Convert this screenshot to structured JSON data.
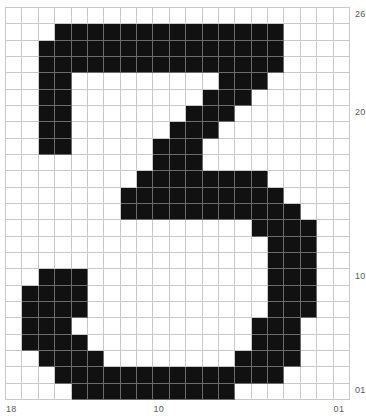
{
  "chart_data": {
    "type": "heatmap",
    "title": "",
    "xlabel": "",
    "ylabel": "",
    "grid": {
      "columns": 21,
      "rows": 24,
      "on_color": "#111111",
      "off_color": "#ffffff",
      "line_color": "#c9c9c9"
    },
    "axes": {
      "y_ticks": [
        {
          "label": "26",
          "row": 0
        },
        {
          "label": "20",
          "row": 6
        },
        {
          "label": "10",
          "row": 16
        },
        {
          "label": "01",
          "row": 23
        }
      ],
      "x_ticks": [
        {
          "label": "18",
          "col": 0
        },
        {
          "label": "10",
          "col": 9
        },
        {
          "label": "01",
          "col": 20
        }
      ]
    },
    "values": [
      [
        0,
        0,
        0,
        0,
        0,
        0,
        0,
        0,
        0,
        0,
        0,
        0,
        0,
        0,
        0,
        0,
        0,
        0,
        0,
        0,
        0
      ],
      [
        0,
        0,
        0,
        1,
        1,
        1,
        1,
        1,
        1,
        1,
        1,
        1,
        1,
        1,
        1,
        1,
        1,
        0,
        0,
        0,
        0
      ],
      [
        0,
        0,
        1,
        1,
        1,
        1,
        1,
        1,
        1,
        1,
        1,
        1,
        1,
        1,
        1,
        1,
        1,
        0,
        0,
        0,
        0
      ],
      [
        0,
        0,
        1,
        1,
        1,
        1,
        1,
        1,
        1,
        1,
        1,
        1,
        1,
        1,
        1,
        1,
        1,
        0,
        0,
        0,
        0
      ],
      [
        0,
        0,
        1,
        1,
        0,
        0,
        0,
        0,
        0,
        0,
        0,
        0,
        0,
        1,
        1,
        1,
        0,
        0,
        0,
        0,
        0
      ],
      [
        0,
        0,
        1,
        1,
        0,
        0,
        0,
        0,
        0,
        0,
        0,
        0,
        1,
        1,
        1,
        0,
        0,
        0,
        0,
        0,
        0
      ],
      [
        0,
        0,
        1,
        1,
        0,
        0,
        0,
        0,
        0,
        0,
        0,
        1,
        1,
        1,
        0,
        0,
        0,
        0,
        0,
        0,
        0
      ],
      [
        0,
        0,
        1,
        1,
        0,
        0,
        0,
        0,
        0,
        0,
        1,
        1,
        1,
        0,
        0,
        0,
        0,
        0,
        0,
        0,
        0
      ],
      [
        0,
        0,
        1,
        1,
        0,
        0,
        0,
        0,
        0,
        1,
        1,
        1,
        0,
        0,
        0,
        0,
        0,
        0,
        0,
        0,
        0
      ],
      [
        0,
        0,
        0,
        0,
        0,
        0,
        0,
        0,
        0,
        1,
        1,
        1,
        0,
        0,
        0,
        0,
        0,
        0,
        0,
        0,
        0
      ],
      [
        0,
        0,
        0,
        0,
        0,
        0,
        0,
        0,
        1,
        1,
        1,
        1,
        1,
        1,
        1,
        1,
        0,
        0,
        0,
        0,
        0
      ],
      [
        0,
        0,
        0,
        0,
        0,
        0,
        0,
        1,
        1,
        1,
        1,
        1,
        1,
        1,
        1,
        1,
        1,
        0,
        0,
        0,
        0
      ],
      [
        0,
        0,
        0,
        0,
        0,
        0,
        0,
        1,
        1,
        1,
        1,
        1,
        1,
        1,
        1,
        1,
        1,
        1,
        0,
        0,
        0
      ],
      [
        0,
        0,
        0,
        0,
        0,
        0,
        0,
        0,
        0,
        0,
        0,
        0,
        0,
        0,
        0,
        1,
        1,
        1,
        1,
        0,
        0
      ],
      [
        0,
        0,
        0,
        0,
        0,
        0,
        0,
        0,
        0,
        0,
        0,
        0,
        0,
        0,
        0,
        0,
        1,
        1,
        1,
        0,
        0
      ],
      [
        0,
        0,
        0,
        0,
        0,
        0,
        0,
        0,
        0,
        0,
        0,
        0,
        0,
        0,
        0,
        0,
        1,
        1,
        1,
        0,
        0
      ],
      [
        0,
        0,
        1,
        1,
        1,
        0,
        0,
        0,
        0,
        0,
        0,
        0,
        0,
        0,
        0,
        0,
        1,
        1,
        1,
        0,
        0
      ],
      [
        0,
        1,
        1,
        1,
        1,
        0,
        0,
        0,
        0,
        0,
        0,
        0,
        0,
        0,
        0,
        0,
        1,
        1,
        1,
        0,
        0
      ],
      [
        0,
        1,
        1,
        1,
        1,
        0,
        0,
        0,
        0,
        0,
        0,
        0,
        0,
        0,
        0,
        0,
        1,
        1,
        1,
        0,
        0
      ],
      [
        0,
        1,
        1,
        1,
        0,
        0,
        0,
        0,
        0,
        0,
        0,
        0,
        0,
        0,
        0,
        1,
        1,
        1,
        0,
        0,
        0
      ],
      [
        0,
        1,
        1,
        1,
        1,
        0,
        0,
        0,
        0,
        0,
        0,
        0,
        0,
        0,
        0,
        1,
        1,
        1,
        0,
        0,
        0
      ],
      [
        0,
        0,
        1,
        1,
        1,
        1,
        0,
        0,
        0,
        0,
        0,
        0,
        0,
        0,
        1,
        1,
        1,
        1,
        0,
        0,
        0
      ],
      [
        0,
        0,
        0,
        1,
        1,
        1,
        1,
        1,
        1,
        1,
        1,
        1,
        1,
        1,
        1,
        1,
        1,
        0,
        0,
        0,
        0
      ],
      [
        0,
        0,
        0,
        0,
        1,
        1,
        1,
        1,
        1,
        1,
        1,
        1,
        1,
        1,
        0,
        0,
        0,
        0,
        0,
        0,
        0
      ]
    ]
  }
}
